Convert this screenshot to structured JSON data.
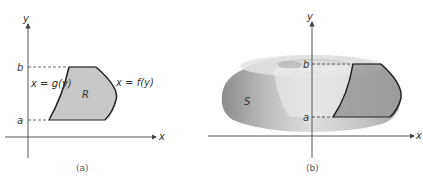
{
  "figure": {
    "panel_a": {
      "caption": "(a)",
      "axis_x_label": "x",
      "axis_y_label": "y",
      "tick_b": "b",
      "tick_a": "a",
      "left_curve_label": "x = g(y)",
      "right_curve_label": "x = f(y)",
      "region_label": "R"
    },
    "panel_b": {
      "caption": "(b)",
      "axis_x_label": "x",
      "axis_y_label": "y",
      "tick_b": "b",
      "tick_a": "a",
      "solid_label": "S"
    }
  },
  "colors": {
    "axis": "#444444",
    "region_fill": "#c8c8c8",
    "outline": "#222222",
    "solid_dark": "#8a8a8a",
    "solid_light": "#e6e6e6"
  }
}
